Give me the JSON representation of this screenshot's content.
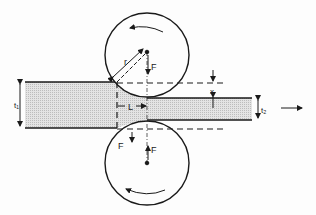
{
  "diagram": {
    "type": "rolling-process-schematic",
    "labels": {
      "roll_radius": "r",
      "force_top": "F",
      "force_bottom": "F",
      "force_bottom_left": "F",
      "contact_length": "L",
      "entry_thickness": "t₁",
      "exit_thickness": "t₂",
      "draft": "x"
    },
    "colors": {
      "line": "#1a1a1a",
      "strip_fill": "#d9d9d9",
      "background": "#fdfdfd"
    }
  }
}
